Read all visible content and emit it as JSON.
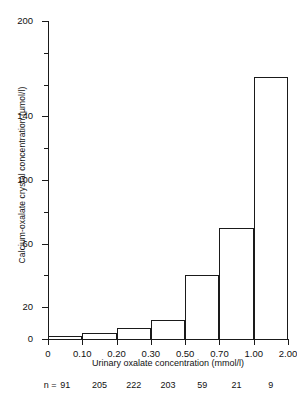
{
  "chart_data": {
    "type": "bar",
    "title": "",
    "xlabel": "Urinary oxalate concentration  (mmol/l)",
    "ylabel": "Calcium-oxalate crystal concentration (µmol/l)",
    "categories": [
      "0–0.10",
      "0.10–0.20",
      "0.20–0.30",
      "0.30–0.50",
      "0.50–0.70",
      "0.70–1.00",
      "1.00–2.00"
    ],
    "values": [
      2,
      4,
      7,
      12,
      40,
      70,
      165
    ],
    "n_label": "n =",
    "n_values": [
      91,
      205,
      222,
      203,
      59,
      21,
      9
    ],
    "x_tick_labels": [
      "0",
      "0.10",
      "0.20",
      "0.30",
      "0.50",
      "0.70",
      "1.00",
      "2.00"
    ],
    "y_major_ticks": [
      0,
      20,
      60,
      100,
      140,
      200
    ],
    "y_major_labels": [
      "0",
      "20",
      "60",
      "100",
      "140",
      "200"
    ],
    "y_minor_ticks": [
      40,
      80,
      120,
      160,
      180
    ],
    "ylim": [
      0,
      200
    ],
    "grid": false,
    "legend": "none",
    "axis_color": "#1a1a1a",
    "bar_fill": "none",
    "bar_edge": "#1a1a1a"
  }
}
